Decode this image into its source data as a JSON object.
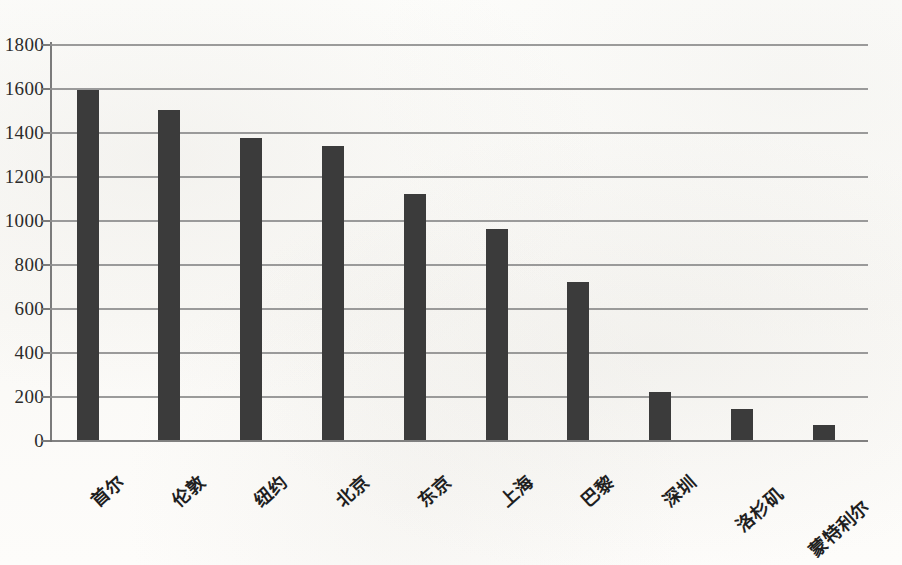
{
  "chart_data": {
    "type": "bar",
    "title": "",
    "subtitle": "",
    "xlabel": "",
    "ylabel": "",
    "categories": [
      "首尔",
      "伦敦",
      "纽约",
      "北京",
      "东京",
      "上海",
      "巴黎",
      "深圳",
      "洛杉矶",
      "蒙特利尔"
    ],
    "values": [
      1590,
      1500,
      1375,
      1335,
      1120,
      960,
      720,
      220,
      140,
      70
    ],
    "series": [
      {
        "name": "",
        "values": [
          1590,
          1500,
          1375,
          1335,
          1120,
          960,
          720,
          220,
          140,
          70
        ]
      }
    ],
    "ylim": [
      0,
      1800
    ],
    "y_ticks": [
      0,
      200,
      400,
      600,
      800,
      1000,
      1200,
      1400,
      1600,
      1800
    ],
    "y_tick_labels": [
      "0",
      "200",
      "400",
      "600",
      "800",
      "1000",
      "1200",
      "1400",
      "1600",
      "1800"
    ],
    "grid": true,
    "grid_axis": "y",
    "legend": false,
    "legend_position": "none",
    "bar_color": "#3b3b3b",
    "gridline_color": "#8d8d8d",
    "axis_color": "#7b7b7b",
    "background_color": "#fcfcfa",
    "xtick_rotation": -42
  }
}
